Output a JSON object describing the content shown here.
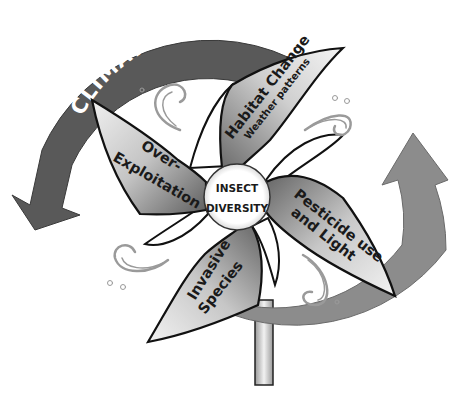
{
  "diagram": {
    "hub": {
      "line1": "INSECT",
      "line2": "DIVERSITY"
    },
    "arrows": [
      {
        "id": "climate",
        "label": "CLIMATE",
        "direction": "counter-clockwise, pointing down-left",
        "color": "#595959"
      },
      {
        "id": "change",
        "label": "CHANGE",
        "direction": "clockwise from bottom, pointing up-right",
        "color": "#8c8c8c"
      }
    ],
    "blades": [
      {
        "id": "habitat",
        "label": "Habitat Change",
        "sublabel": "Weather patterns"
      },
      {
        "id": "pesticide",
        "label_line1": "Pesticide use",
        "label_line2": "and Light"
      },
      {
        "id": "invasive",
        "label_line1": "Invasive",
        "label_line2": "Species"
      },
      {
        "id": "overexploitation",
        "label_line1": "Over-",
        "label_line2": "Exploitation"
      }
    ],
    "colors": {
      "climate_arrow": "#595959",
      "change_arrow": "#8c8c8c",
      "blade_dark": "#6e6e6e",
      "blade_light": "#f2f2f2",
      "outline": "#111111",
      "swirl": "#9a9a9a"
    },
    "decorations": [
      "swirl-top-left",
      "swirl-top-right",
      "swirl-bottom-left",
      "swirl-bottom-right"
    ]
  }
}
